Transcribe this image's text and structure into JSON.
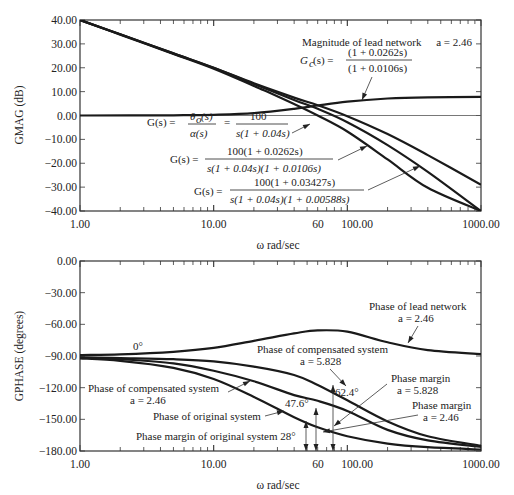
{
  "chart_data": [
    {
      "type": "line",
      "id": "magnitude",
      "title": "",
      "xlabel": "ω rad/sec",
      "ylabel": "GMAG (dB)",
      "xscale": "log",
      "xlim": [
        1,
        1000
      ],
      "ylim": [
        -40,
        40
      ],
      "yticks": [
        "40.00",
        "30.00",
        "20.00",
        "10.00",
        "0.00",
        "-10.00",
        "-20.00",
        "-30.00",
        "-40.00"
      ],
      "xtick_labels": [
        {
          "x": 1,
          "label": "1.00"
        },
        {
          "x": 10,
          "label": "10.00"
        },
        {
          "x": 60,
          "label": "60"
        },
        {
          "x": 100,
          "label": "100.00"
        },
        {
          "x": 1000,
          "label": "1000.00"
        }
      ],
      "grid": false,
      "reference_line": {
        "y": 0
      },
      "series": [
        {
          "name": "Original system G(s) = 100 / s(1 + 0.04s)",
          "x": [
            1,
            2,
            5,
            10,
            20,
            25,
            40,
            60,
            100,
            200,
            400,
            1000
          ],
          "y": [
            40.0,
            33.9,
            25.8,
            19.6,
            12.4,
            10.0,
            4.8,
            0.0,
            -6.7,
            -18.4,
            -30.3,
            -40
          ]
        },
        {
          "name": "Compensated a = 2.46 G(s) = 100(1 + 0.0262s) / s(1 + 0.04s)(1 + 0.0106s)",
          "x": [
            1,
            2,
            5,
            10,
            20,
            40,
            60,
            100,
            200,
            400,
            1000
          ],
          "y": [
            40.0,
            34.0,
            26.0,
            20.0,
            13.2,
            6.5,
            2.8,
            -2.8,
            -12.4,
            -23.6,
            -40
          ]
        },
        {
          "name": "Compensated a = 5.828 G(s) = 100(1 + 0.03427s) / s(1 + 0.04s)(1 + 0.00588s)",
          "x": [
            1,
            2,
            5,
            10,
            20,
            40,
            60,
            100,
            200,
            400,
            1000
          ],
          "y": [
            40.0,
            34.0,
            26.0,
            20.0,
            13.5,
            7.5,
            4.3,
            -0.3,
            -7.8,
            -16.6,
            -29.0
          ]
        },
        {
          "name": "Magnitude of lead network a = 2.46 Gc(s) = (1 + 0.0262s)/(1 + 0.0106s)",
          "x": [
            1,
            5,
            10,
            20,
            40,
            60,
            100,
            200,
            400,
            1000
          ],
          "y": [
            0.0,
            0.1,
            0.3,
            1.0,
            2.8,
            4.2,
            5.8,
            7.1,
            7.6,
            7.8
          ]
        }
      ],
      "annotations": [
        "Magnitude of lead network a = 2.46",
        "Gc(s) = (1 + 0.0262s)/(1 + 0.0106s)",
        "G(s) = θo(s)/α(s) = 100/s(1 + 0.04s)",
        "G(s) = 100(1 + 0.0262s)/s(1 + 0.04s)(1 + 0.0106s)",
        "G(s) = 100(1 + 0.03427s)/s(1 + 0.04s)(1 + 0.00588s)"
      ]
    },
    {
      "type": "line",
      "id": "phase",
      "title": "",
      "xlabel": "ω rad/sec",
      "ylabel": "GPHASE (degrees)",
      "xscale": "log",
      "xlim": [
        1,
        1000
      ],
      "ylim": [
        -180,
        0
      ],
      "yticks": [
        "0.00",
        "-30.00",
        "-60.00",
        "-90.00",
        "-120.00",
        "-150.00",
        "-180.00"
      ],
      "xtick_labels": [
        {
          "x": 1,
          "label": "1.00"
        },
        {
          "x": 10,
          "label": "10.00"
        },
        {
          "x": 60,
          "label": "60"
        },
        {
          "x": 100,
          "label": "100.00"
        },
        {
          "x": 1000,
          "label": "1000.00"
        }
      ],
      "grid": false,
      "series": [
        {
          "name": "Phase of lead network a = 2.46",
          "x": [
            1,
            2,
            5,
            10,
            20,
            40,
            60,
            100,
            200,
            400,
            1000
          ],
          "y": [
            -89.1,
            -88.4,
            -86.0,
            -82.3,
            -75.6,
            -68.6,
            -65.7,
            -67.0,
            -77.0,
            -84.5,
            -88.2
          ]
        },
        {
          "name": "Phase of compensated system a = 5.828",
          "x": [
            1,
            2,
            5,
            10,
            20,
            40,
            60,
            100,
            200,
            400,
            1000
          ],
          "y": [
            -91.2,
            -92.0,
            -93.0,
            -95.0,
            -100.0,
            -108.0,
            -117.6,
            -132.0,
            -152.0,
            -166.0,
            -175.0
          ]
        },
        {
          "name": "Phase of compensated system a = 2.46",
          "x": [
            1,
            2,
            5,
            10,
            20,
            40,
            60,
            100,
            200,
            400,
            1000
          ],
          "y": [
            -91.4,
            -93.0,
            -97.0,
            -104.0,
            -114.0,
            -127.0,
            -132.4,
            -142.0,
            -160.0,
            -170.0,
            -176.0
          ]
        },
        {
          "name": "Phase of original system",
          "x": [
            1,
            2,
            5,
            10,
            20,
            40,
            60,
            100,
            200,
            400,
            1000
          ],
          "y": [
            -92.3,
            -94.6,
            -101.3,
            -111.8,
            -128.7,
            -148.0,
            -157.5,
            -166.0,
            -173.0,
            -176.4,
            -178.6
          ]
        }
      ],
      "annotations": [
        "0°",
        "Phase of lead network a = 2.46",
        "Phase of compensated system a = 5.828",
        "Phase of compensated system a = 2.46",
        "Phase of original system",
        "Phase margin a = 5.828",
        "Phase margin a = 2.46",
        "Phase margin of original system 28°",
        "47.6°",
        "62.4°"
      ],
      "phase_margins": [
        {
          "label": "28°",
          "x": 50,
          "value": 28
        },
        {
          "label": "47.6°",
          "x": 60,
          "value": 47.6
        },
        {
          "label": "62.4°",
          "x": 80,
          "value": 62.4
        }
      ]
    }
  ],
  "labels": {
    "mag_ylabel": "GMAG (dB)",
    "phase_ylabel": "GPHASE (degrees)",
    "xlabel": "ω rad/sec",
    "lead_mag_title": "Magnitude of lead network a = 2.46",
    "lead_phase_l1": "Phase of lead network",
    "lead_phase_l2": "a = 2.46",
    "comp5828_l1": "Phase of compensated system",
    "comp5828_l2": "a = 5.828",
    "comp246_l1": "Phase of compensated system",
    "comp246_l2": "a = 2.46",
    "orig_phase": "Phase of original system",
    "pm_orig": "Phase margin of original system 28°",
    "pm5828_l1": "Phase margin",
    "pm5828_l2": "a = 5.828",
    "pm246_l1": "Phase margin",
    "pm246_l2": "a = 2.46",
    "pm476": "47.6°",
    "pm624": "62.4°",
    "zero_deg": "0°"
  }
}
